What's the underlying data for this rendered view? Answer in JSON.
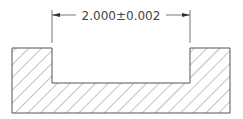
{
  "drawing": {
    "type": "section-view",
    "dimension": {
      "label": "2.000±0.002",
      "nominal": 2.0,
      "tolerance": 0.002
    },
    "colors": {
      "line": "#555555",
      "hatch": "#666666",
      "text": "#444444",
      "background": "#ffffff"
    }
  }
}
